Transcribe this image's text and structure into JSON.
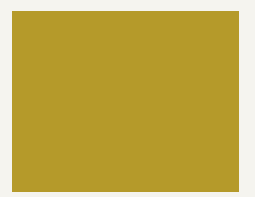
{
  "figure": {
    "credit": "Courtesy EMPA",
    "colors": {
      "page_background": "#f5f4ef",
      "gold_light": "#f0df74",
      "gold_mid": "#d9c24a",
      "gold_shadow": "#8f7a1c",
      "molecule_light": "#8f9be8",
      "molecule_light_shadow": "#6f7ed6",
      "molecule_dark": "#3b4fc4",
      "molecule_dark_shadow": "#2a3a9e",
      "credit_text": "#6b6b68"
    },
    "lattice_rows": [
      {
        "y": 2,
        "r": 4.2,
        "spacing": 9.2
      },
      {
        "y": 9,
        "r": 4.5,
        "spacing": 9.6
      },
      {
        "y": 16,
        "r": 4.8,
        "spacing": 10.0
      },
      {
        "y": 24,
        "r": 5.1,
        "spacing": 10.5
      },
      {
        "y": 32,
        "r": 5.5,
        "spacing": 11.0
      },
      {
        "y": 41,
        "r": 5.9,
        "spacing": 11.6
      },
      {
        "y": 50,
        "r": 6.3,
        "spacing": 12.3
      },
      {
        "y": 60,
        "r": 6.8,
        "spacing": 13.1
      },
      {
        "y": 71,
        "r": 7.3,
        "spacing": 14.0
      },
      {
        "y": 83,
        "r": 7.9,
        "spacing": 15.0
      },
      {
        "y": 96,
        "r": 8.6,
        "spacing": 16.2
      },
      {
        "y": 110,
        "r": 9.4,
        "spacing": 17.6
      },
      {
        "y": 126,
        "r": 10.3,
        "spacing": 19.2
      },
      {
        "y": 143,
        "r": 11.3,
        "spacing": 21.0
      },
      {
        "y": 162,
        "r": 12.4,
        "spacing": 23.0
      },
      {
        "y": 183,
        "r": 13.6,
        "spacing": 25.2
      }
    ],
    "molecule": {
      "light_atoms": [
        [
          135,
          44,
          7
        ],
        [
          142,
          50,
          7
        ],
        [
          150,
          44,
          6
        ],
        [
          146,
          58,
          7
        ],
        [
          156,
          56,
          7
        ],
        [
          163,
          50,
          6
        ],
        [
          170,
          58,
          7
        ],
        [
          176,
          52,
          6
        ],
        [
          182,
          60,
          6
        ],
        [
          186,
          50,
          6
        ],
        [
          188,
          42,
          6
        ],
        [
          181,
          40,
          5
        ],
        [
          160,
          64,
          6
        ],
        [
          150,
          66,
          6
        ],
        [
          140,
          62,
          6
        ],
        [
          132,
          56,
          6
        ],
        [
          168,
          68,
          6
        ],
        [
          178,
          68,
          5
        ],
        [
          128,
          66,
          6
        ],
        [
          122,
          72,
          6
        ],
        [
          116,
          78,
          6
        ],
        [
          110,
          84,
          6
        ],
        [
          104,
          90,
          7
        ],
        [
          96,
          94,
          7
        ],
        [
          100,
          102,
          7
        ],
        [
          108,
          100,
          6
        ],
        [
          88,
          98,
          7
        ],
        [
          80,
          102,
          7
        ],
        [
          72,
          100,
          7
        ],
        [
          64,
          98,
          6
        ],
        [
          58,
          104,
          7
        ],
        [
          50,
          108,
          7
        ],
        [
          44,
          114,
          7
        ],
        [
          40,
          106,
          6
        ],
        [
          52,
          118,
          7
        ],
        [
          62,
          114,
          7
        ],
        [
          72,
          112,
          7
        ],
        [
          82,
          112,
          7
        ],
        [
          90,
          108,
          6
        ],
        [
          76,
          122,
          7
        ],
        [
          66,
          126,
          7
        ],
        [
          58,
          130,
          7
        ],
        [
          50,
          126,
          6
        ],
        [
          68,
          138,
          6
        ],
        [
          60,
          140,
          6
        ],
        [
          56,
          120,
          6
        ],
        [
          86,
          120,
          6
        ],
        [
          94,
          116,
          6
        ]
      ],
      "dark_atoms": [
        [
          134,
          34,
          6
        ],
        [
          140,
          31,
          5
        ],
        [
          130,
          40,
          5
        ],
        [
          192,
          68,
          8
        ],
        [
          202,
          62,
          8
        ],
        [
          210,
          70,
          8
        ],
        [
          200,
          76,
          8
        ],
        [
          190,
          84,
          7
        ],
        [
          198,
          90,
          8
        ],
        [
          206,
          84,
          7
        ],
        [
          196,
          98,
          6
        ],
        [
          184,
          78,
          6
        ],
        [
          16,
          106,
          6
        ],
        [
          24,
          104,
          6
        ],
        [
          32,
          108,
          6
        ],
        [
          38,
          116,
          5
        ],
        [
          28,
          114,
          5
        ],
        [
          74,
          148,
          8
        ],
        [
          84,
          150,
          8
        ],
        [
          94,
          152,
          8
        ],
        [
          102,
          146,
          7
        ],
        [
          106,
          156,
          7
        ],
        [
          96,
          160,
          7
        ],
        [
          86,
          160,
          7
        ],
        [
          76,
          156,
          7
        ],
        [
          68,
          146,
          6
        ],
        [
          142,
          60,
          4
        ],
        [
          90,
          104,
          4
        ]
      ]
    }
  }
}
